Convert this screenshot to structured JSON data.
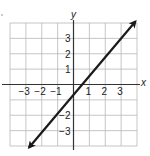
{
  "chart_data": {
    "type": "line",
    "title": "",
    "xlabel": "x",
    "ylabel": "y",
    "xlim": [
      -4,
      4
    ],
    "ylim": [
      -4,
      4
    ],
    "grid": true,
    "x_ticks": [
      -3,
      -2,
      -1,
      1,
      2,
      3
    ],
    "y_ticks": [
      3,
      2,
      1,
      -2,
      -3
    ],
    "x_tick_labels": [
      "−3",
      "−2",
      "−1",
      "1",
      "2",
      "3"
    ],
    "y_tick_labels": [
      "3",
      "2",
      "1",
      "−2",
      "−3"
    ],
    "series": [
      {
        "name": "line",
        "x": [
          -2.8,
          0.35,
          1.0,
          2.0,
          3.9
        ],
        "y": [
          -4.1,
          0,
          0.9,
          2.0,
          4.1
        ],
        "style": "solid line with arrowheads at both ends"
      }
    ],
    "legend": null
  },
  "colors": {
    "grid": "#b8b8b8",
    "axis": "#333333",
    "line": "#1a1a1a",
    "text": "#222222",
    "background": "#ffffff"
  },
  "labels": {
    "x_axis": "x",
    "y_axis": "y",
    "x_ticks": [
      {
        "text": "−3",
        "value": -3
      },
      {
        "text": "−2",
        "value": -2
      },
      {
        "text": "−1",
        "value": -1
      },
      {
        "text": "1",
        "value": 1
      },
      {
        "text": "2",
        "value": 2
      },
      {
        "text": "3",
        "value": 3
      }
    ],
    "y_ticks": [
      {
        "text": "3",
        "value": 3
      },
      {
        "text": "2",
        "value": 2
      },
      {
        "text": "1",
        "value": 1
      },
      {
        "text": "−2",
        "value": -2
      },
      {
        "text": "−3",
        "value": -3
      }
    ]
  }
}
